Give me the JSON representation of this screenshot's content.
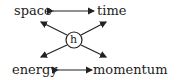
{
  "diagram": {
    "nodes": {
      "top_left": "space",
      "top_right": "time",
      "bottom_left": "energy",
      "bottom_right": "momentum",
      "center": "h"
    },
    "edges": [
      {
        "from": "space",
        "to": "time",
        "type": "double-arrow"
      },
      {
        "from": "energy",
        "to": "momentum",
        "type": "double-arrow"
      },
      {
        "from": "h",
        "to": "space",
        "type": "arrow"
      },
      {
        "from": "h",
        "to": "time",
        "type": "arrow"
      },
      {
        "from": "h",
        "to": "energy",
        "type": "arrow"
      },
      {
        "from": "h",
        "to": "momentum",
        "type": "arrow"
      }
    ],
    "colors": {
      "ink": "#222222",
      "background": "#ffffff"
    }
  }
}
